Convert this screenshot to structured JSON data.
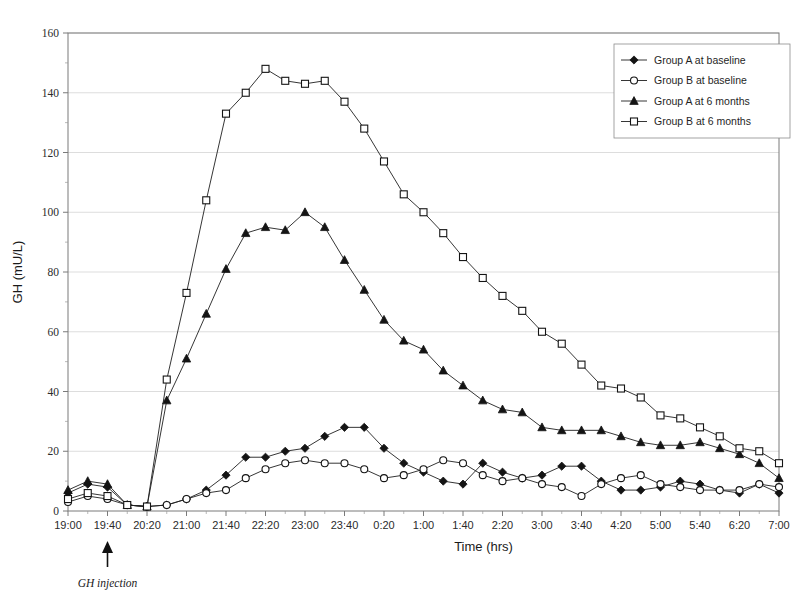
{
  "chart_data": {
    "type": "line",
    "title": "",
    "xlabel": "Time (hrs)",
    "ylabel": "GH (mU/L)",
    "ylim": [
      0,
      160
    ],
    "ytick_step": 20,
    "yticks": [
      0,
      20,
      40,
      60,
      80,
      100,
      120,
      140,
      160
    ],
    "grid": "horizontal-major-light",
    "legend_position": "top-right",
    "x": [
      "19:00",
      "19:20",
      "19:40",
      "20:00",
      "20:20",
      "20:40",
      "21:00",
      "21:20",
      "21:40",
      "22:00",
      "22:20",
      "22:40",
      "23:00",
      "23:20",
      "23:40",
      "0:00",
      "0:20",
      "0:40",
      "1:00",
      "1:20",
      "1:40",
      "2:00",
      "2:20",
      "2:40",
      "3:00",
      "3:20",
      "3:40",
      "4:00",
      "4:20",
      "4:40",
      "5:00",
      "5:20",
      "5:40",
      "6:00",
      "6:20",
      "6:40",
      "7:00"
    ],
    "xtick_labels": [
      "19:00",
      "19:40",
      "20:20",
      "21:00",
      "21:40",
      "22:20",
      "23:00",
      "23:40",
      "0:20",
      "1:00",
      "1:40",
      "2:20",
      "3:00",
      "3:40",
      "4:20",
      "5:00",
      "5:40",
      "6:20",
      "7:00"
    ],
    "series": [
      {
        "name": "Group A at baseline",
        "marker": "filled-diamond",
        "values": [
          6,
          9,
          8,
          2,
          1.5,
          2,
          4,
          7,
          12,
          18,
          18,
          20,
          21,
          25,
          28,
          28,
          21,
          16,
          13,
          10,
          9,
          16,
          13,
          11,
          12,
          15,
          15,
          10,
          7,
          7,
          8,
          10,
          9,
          7,
          6,
          9,
          6
        ]
      },
      {
        "name": "Group B at baseline",
        "marker": "open-circle",
        "values": [
          3,
          5,
          4,
          2,
          1.5,
          2,
          4,
          6,
          7,
          11,
          14,
          16,
          17,
          16,
          16,
          14,
          11,
          12,
          14,
          17,
          16,
          12,
          10,
          11,
          9,
          8,
          5,
          9,
          11,
          12,
          9,
          8,
          7,
          7,
          7,
          9,
          8
        ]
      },
      {
        "name": "Group A at 6 months",
        "marker": "filled-triangle",
        "values": [
          7,
          10,
          9,
          2,
          1.5,
          37,
          51,
          66,
          81,
          93,
          95,
          94,
          100,
          95,
          84,
          74,
          64,
          57,
          54,
          47,
          42,
          37,
          34,
          33,
          28,
          27,
          27,
          27,
          25,
          23,
          22,
          22,
          23,
          21,
          19,
          16,
          11
        ]
      },
      {
        "name": "Group B at 6 months",
        "marker": "open-square",
        "values": [
          4,
          6,
          5,
          2,
          1.5,
          44,
          73,
          104,
          133,
          140,
          148,
          144,
          143,
          144,
          137,
          128,
          117,
          106,
          100,
          93,
          85,
          78,
          72,
          67,
          60,
          56,
          49,
          42,
          41,
          38,
          32,
          31,
          28,
          25,
          21,
          20,
          16
        ]
      }
    ],
    "annotations": [
      {
        "text": "GH injection",
        "at_x": "19:40",
        "style": "arrow-up-below-axis"
      }
    ]
  },
  "legend": {
    "items": [
      {
        "label": "Group A at baseline",
        "marker": "filled-diamond"
      },
      {
        "label": "Group B at baseline",
        "marker": "open-circle"
      },
      {
        "label": "Group A at 6 months",
        "marker": "filled-triangle"
      },
      {
        "label": "Group B at 6 months",
        "marker": "open-square"
      }
    ]
  }
}
